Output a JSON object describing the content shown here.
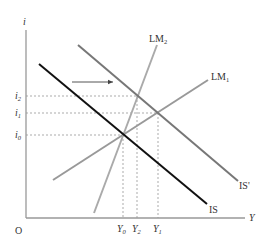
{
  "diagram": {
    "type": "IS-LM",
    "axes": {
      "y_label": "i",
      "x_label": "Y",
      "origin_label": "O"
    },
    "curves": [
      {
        "id": "IS",
        "label": "IS",
        "label_sub": "",
        "color": "#111111",
        "kind": "downward"
      },
      {
        "id": "IS_prime",
        "label": "IS'",
        "label_sub": "",
        "color": "#777777",
        "kind": "downward"
      },
      {
        "id": "LM1",
        "label": "LM",
        "label_sub": "1",
        "color": "#999999",
        "kind": "upward"
      },
      {
        "id": "LM2",
        "label": "LM",
        "label_sub": "2",
        "color": "#aaaaaa",
        "kind": "upward"
      }
    ],
    "interest_levels": [
      {
        "id": "i2",
        "label": "i",
        "sub": "2"
      },
      {
        "id": "i1",
        "label": "i",
        "sub": "1"
      },
      {
        "id": "i0",
        "label": "i",
        "sub": "0"
      }
    ],
    "output_levels": [
      {
        "id": "Y0",
        "label": "Y",
        "sub": "0"
      },
      {
        "id": "Y2",
        "label": "Y",
        "sub": "2"
      },
      {
        "id": "Y1",
        "label": "Y",
        "sub": "1"
      }
    ],
    "arrow": {
      "meaning": "IS shifts right to IS'"
    },
    "colors": {
      "axis": "#999999",
      "guide": "#888888",
      "arrow": "#555555"
    }
  }
}
